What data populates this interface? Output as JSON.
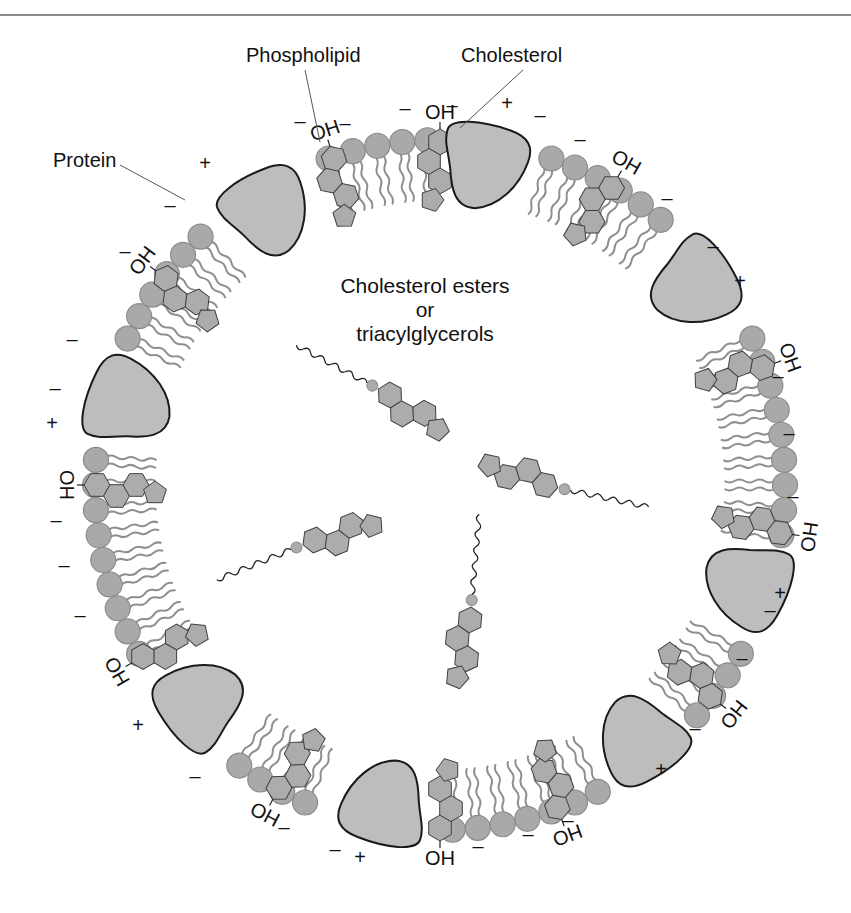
{
  "labels": {
    "phospholipid": "Phospholipid",
    "cholesterol": "Cholesterol",
    "protein": "Protein",
    "core_line1": "Cholesterol esters",
    "core_line2": "or",
    "core_line3": "triacylglycerols",
    "hydroxyl_oh": "OH",
    "hydroxyl_ho": "HO",
    "charge_plus": "+",
    "charge_minus": "–"
  },
  "geometry": {
    "center": [
      440,
      485
    ],
    "head_radius": 345,
    "head_size": 12.5,
    "tail_length": 60
  },
  "colors": {
    "head_fill": "#a9a9a9",
    "head_stroke": "#8c8c8c",
    "tail": "#8f8f8f",
    "protein_fill": "#bdbdbd",
    "protein_stroke": "#1a1a1a",
    "ring_fill": "#acacac",
    "ring_stroke": "#404040",
    "rule": "#8a8a8a"
  },
  "proteins": [
    {
      "angle": 238,
      "label": "protein-top-left"
    },
    {
      "angle": 278,
      "label": "protein-top"
    },
    {
      "angle": 322,
      "label": "protein-top-right"
    },
    {
      "angle": 195,
      "label": "protein-left"
    },
    {
      "angle": 18,
      "label": "protein-right"
    },
    {
      "angle": 138,
      "label": "protein-bottom-left"
    },
    {
      "angle": 100,
      "label": "protein-bottom"
    },
    {
      "angle": 52,
      "label": "protein-bottom-right"
    }
  ],
  "cholesterols": [
    {
      "angle": 252,
      "oh": "OH"
    },
    {
      "angle": 270,
      "oh": "OH"
    },
    {
      "angle": 300,
      "oh": "OH"
    },
    {
      "angle": 217,
      "oh": "OH"
    },
    {
      "angle": 340,
      "oh": "OH"
    },
    {
      "angle": 180,
      "oh": "HO"
    },
    {
      "angle": 8,
      "oh": "HO"
    },
    {
      "angle": 150,
      "oh": "HO"
    },
    {
      "angle": 118,
      "oh": "HO"
    },
    {
      "angle": 90,
      "oh": "HO"
    },
    {
      "angle": 70,
      "oh": "HO"
    },
    {
      "angle": 38,
      "oh": "HO"
    }
  ],
  "charges": [
    {
      "x": 205,
      "y": 170,
      "s": "+"
    },
    {
      "x": 170,
      "y": 212,
      "s": "–"
    },
    {
      "x": 125,
      "y": 258,
      "s": "–"
    },
    {
      "x": 72,
      "y": 346,
      "s": "–"
    },
    {
      "x": 55,
      "y": 395,
      "s": "–"
    },
    {
      "x": 52,
      "y": 430,
      "s": "+"
    },
    {
      "x": 56,
      "y": 527,
      "s": "–"
    },
    {
      "x": 64,
      "y": 572,
      "s": "–"
    },
    {
      "x": 80,
      "y": 622,
      "s": "–"
    },
    {
      "x": 138,
      "y": 732,
      "s": "+"
    },
    {
      "x": 195,
      "y": 783,
      "s": "–"
    },
    {
      "x": 284,
      "y": 834,
      "s": "–"
    },
    {
      "x": 335,
      "y": 856,
      "s": "–"
    },
    {
      "x": 360,
      "y": 864,
      "s": "+"
    },
    {
      "x": 478,
      "y": 853,
      "s": "–"
    },
    {
      "x": 528,
      "y": 841,
      "s": "–"
    },
    {
      "x": 568,
      "y": 827,
      "s": "–"
    },
    {
      "x": 661,
      "y": 776,
      "s": "+"
    },
    {
      "x": 695,
      "y": 735,
      "s": "–"
    },
    {
      "x": 742,
      "y": 665,
      "s": "–"
    },
    {
      "x": 770,
      "y": 617,
      "s": "–"
    },
    {
      "x": 780,
      "y": 600,
      "s": "+"
    },
    {
      "x": 793,
      "y": 503,
      "s": "–"
    },
    {
      "x": 789,
      "y": 440,
      "s": "–"
    },
    {
      "x": 778,
      "y": 383,
      "s": "–"
    },
    {
      "x": 740,
      "y": 288,
      "s": "+"
    },
    {
      "x": 713,
      "y": 253,
      "s": "–"
    },
    {
      "x": 667,
      "y": 205,
      "s": "–"
    },
    {
      "x": 580,
      "y": 146,
      "s": "–"
    },
    {
      "x": 540,
      "y": 122,
      "s": "–"
    },
    {
      "x": 507,
      "y": 110,
      "s": "+"
    },
    {
      "x": 452,
      "y": 112,
      "s": "–"
    },
    {
      "x": 405,
      "y": 115,
      "s": "–"
    },
    {
      "x": 345,
      "y": 130,
      "s": "–"
    },
    {
      "x": 300,
      "y": 128,
      "s": "–"
    }
  ],
  "core_molecules": [
    {
      "x": 390,
      "y": 395,
      "rot": 28,
      "label": "ester-top"
    },
    {
      "x": 545,
      "y": 485,
      "rot": 192,
      "label": "ester-right"
    },
    {
      "x": 315,
      "y": 540,
      "rot": -22,
      "label": "ester-left"
    },
    {
      "x": 470,
      "y": 620,
      "rot": 95,
      "label": "ester-bottom"
    }
  ]
}
